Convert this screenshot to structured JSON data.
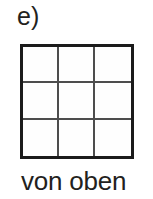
{
  "figure": {
    "item_label": "e)",
    "caption": "von oben",
    "colors": {
      "background": "#ffffff",
      "text": "#231f20",
      "outer_border": "#1b1b1b",
      "inner_lines": "#4d4d4d",
      "cell_fill": "#fefefe"
    }
  },
  "grid": {
    "rows": 3,
    "columns": 3,
    "cell_count": 9,
    "cells": [
      {
        "row": 1,
        "column": 1,
        "label": ""
      },
      {
        "row": 1,
        "column": 2,
        "label": ""
      },
      {
        "row": 1,
        "column": 3,
        "label": ""
      },
      {
        "row": 2,
        "column": 1,
        "label": ""
      },
      {
        "row": 2,
        "column": 2,
        "label": ""
      },
      {
        "row": 2,
        "column": 3,
        "label": ""
      },
      {
        "row": 3,
        "column": 1,
        "label": ""
      },
      {
        "row": 3,
        "column": 2,
        "label": ""
      },
      {
        "row": 3,
        "column": 3,
        "label": ""
      }
    ]
  }
}
